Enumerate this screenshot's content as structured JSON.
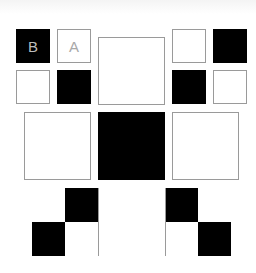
{
  "colors": {
    "black": "#000000",
    "white": "#ffffff",
    "border": "#9a9a9a"
  },
  "tiles": [
    {
      "id": "b",
      "label": "B",
      "color": "black",
      "x": 16,
      "y": 29,
      "w": 34,
      "h": 34
    },
    {
      "id": "a",
      "label": "A",
      "color": "white",
      "x": 57,
      "y": 29,
      "w": 34,
      "h": 34
    },
    {
      "id": "tl2",
      "label": "",
      "color": "white",
      "x": 16,
      "y": 70,
      "w": 34,
      "h": 34
    },
    {
      "id": "tl3",
      "label": "",
      "color": "black",
      "x": 57,
      "y": 70,
      "w": 34,
      "h": 34
    },
    {
      "id": "tc",
      "label": "",
      "color": "white",
      "x": 98,
      "y": 37,
      "w": 67,
      "h": 68
    },
    {
      "id": "tr1",
      "label": "",
      "color": "white",
      "x": 172,
      "y": 29,
      "w": 34,
      "h": 34
    },
    {
      "id": "tr2",
      "label": "",
      "color": "black",
      "x": 213,
      "y": 29,
      "w": 34,
      "h": 34
    },
    {
      "id": "tr3",
      "label": "",
      "color": "black",
      "x": 172,
      "y": 70,
      "w": 34,
      "h": 34
    },
    {
      "id": "tr4",
      "label": "",
      "color": "white",
      "x": 213,
      "y": 70,
      "w": 34,
      "h": 34
    },
    {
      "id": "ml",
      "label": "",
      "color": "white",
      "x": 24,
      "y": 112,
      "w": 67,
      "h": 68
    },
    {
      "id": "mc",
      "label": "",
      "color": "black",
      "x": 98,
      "y": 112,
      "w": 67,
      "h": 68
    },
    {
      "id": "mr",
      "label": "",
      "color": "white",
      "x": 172,
      "y": 112,
      "w": 67,
      "h": 68
    }
  ],
  "bottom_strip": {
    "x": 32,
    "y": 188,
    "w": 199,
    "h": 68,
    "cells": [
      {
        "color": "white",
        "x": 0,
        "y": 0,
        "w": 33,
        "h": 34
      },
      {
        "color": "black",
        "x": 33,
        "y": 0,
        "w": 33,
        "h": 34
      },
      {
        "color": "black",
        "x": 0,
        "y": 34,
        "w": 33,
        "h": 34
      },
      {
        "color": "white",
        "x": 33,
        "y": 34,
        "w": 33,
        "h": 34
      },
      {
        "color": "white",
        "x": 66,
        "y": 0,
        "w": 67,
        "h": 68
      },
      {
        "color": "black",
        "x": 133,
        "y": 0,
        "w": 33,
        "h": 34
      },
      {
        "color": "white",
        "x": 166,
        "y": 0,
        "w": 33,
        "h": 34
      },
      {
        "color": "white",
        "x": 133,
        "y": 34,
        "w": 33,
        "h": 34
      },
      {
        "color": "black",
        "x": 166,
        "y": 34,
        "w": 33,
        "h": 34
      }
    ]
  }
}
